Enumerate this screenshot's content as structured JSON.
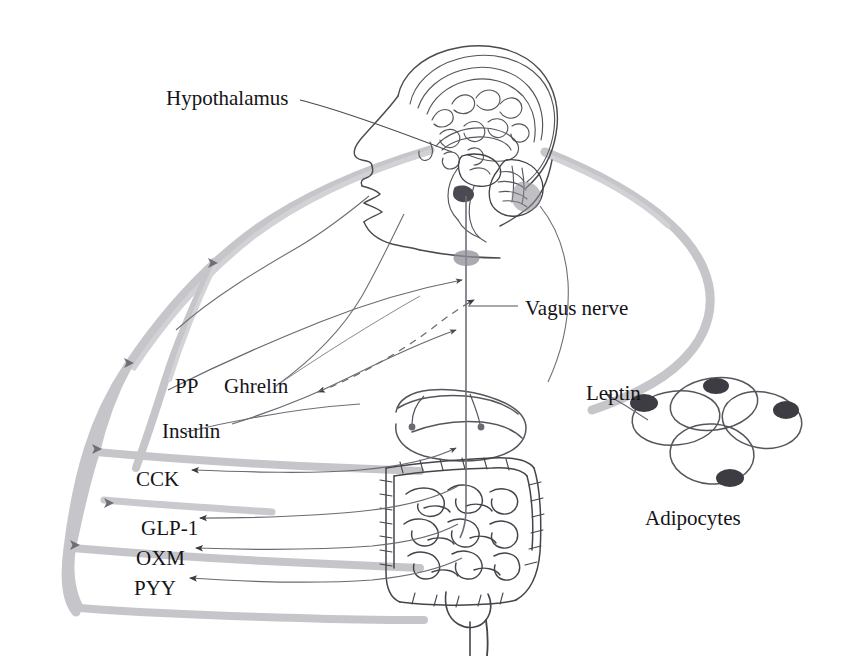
{
  "figure": {
    "kind": "anatomical-diagram",
    "canvas": {
      "width": 847,
      "height": 656
    },
    "background_color": "#ffffff"
  },
  "palette": {
    "text": "#141418",
    "anatomy_ink": "#4a4a50",
    "anatomy_ink_dark": "#2e2e33",
    "pathway_gray": "#bcbcc0",
    "pathway_gray_light": "#cfcfd3",
    "arrow_ink": "#6a6a70",
    "arrowhead": "#3a3a40",
    "nucleus_fill": "#3c3c42"
  },
  "labels": [
    {
      "id": "hypothalamus",
      "text": "Hypothalamus",
      "x": 166,
      "y": 88,
      "anchor": "left"
    },
    {
      "id": "vagus-nerve",
      "text": "Vagus nerve",
      "x": 525,
      "y": 298,
      "anchor": "left"
    },
    {
      "id": "pp",
      "text": "PP",
      "x": 175,
      "y": 376,
      "anchor": "left"
    },
    {
      "id": "ghrelin",
      "text": "Ghrelin",
      "x": 224,
      "y": 376,
      "anchor": "left"
    },
    {
      "id": "leptin",
      "text": "Leptin",
      "x": 586,
      "y": 383,
      "anchor": "left"
    },
    {
      "id": "insulin",
      "text": "Insulin",
      "x": 162,
      "y": 421,
      "anchor": "left"
    },
    {
      "id": "cck",
      "text": "CCK",
      "x": 136,
      "y": 469,
      "anchor": "left"
    },
    {
      "id": "glp1",
      "text": "GLP-1",
      "x": 141,
      "y": 518,
      "anchor": "left"
    },
    {
      "id": "adipocytes",
      "text": "Adipocytes",
      "x": 700,
      "y": 508,
      "anchor": "center"
    },
    {
      "id": "oxm",
      "text": "OXM",
      "x": 136,
      "y": 548,
      "anchor": "left"
    },
    {
      "id": "pyy",
      "text": "PYY",
      "x": 134,
      "y": 578,
      "anchor": "left"
    }
  ],
  "anatomy_parts": [
    {
      "id": "head-profile",
      "name": "human head in profile (sagittal)"
    },
    {
      "id": "brain-section",
      "name": "mid-sagittal brain section with cortex, corpus callosum, brainstem, cerebellum"
    },
    {
      "id": "hypothalamus-node",
      "name": "hypothalamus region marker"
    },
    {
      "id": "stomach",
      "name": "stomach"
    },
    {
      "id": "large-intestine",
      "name": "large intestine / colon frame"
    },
    {
      "id": "small-intestine",
      "name": "small intestine coils"
    },
    {
      "id": "rectum",
      "name": "sigmoid colon and rectum"
    },
    {
      "id": "vagus-trunk",
      "name": "vagus nerve descending trunk with ganglion"
    },
    {
      "id": "adipocyte-cluster",
      "name": "cluster of four adipocytes with nuclei"
    }
  ],
  "pathways": [
    {
      "id": "systemic-left-arc",
      "style": "thick-gray",
      "note": "circulation arc from head down the left body contour"
    },
    {
      "id": "leptin-arc-right",
      "style": "thick-gray",
      "note": "S-curve from head down the right toward adipose tissue"
    },
    {
      "id": "hormone-branch-pp",
      "style": "thin-arrow",
      "note": "PP to brain"
    },
    {
      "id": "hormone-branch-ghrelin",
      "style": "dashed-arrow",
      "note": "Ghrelin bidirectional to brain"
    },
    {
      "id": "hormone-branch-insulin",
      "style": "thin-arrow",
      "note": "Insulin to brain"
    },
    {
      "id": "hormone-branch-cck",
      "style": "thin-arrow",
      "note": "CCK from gut"
    },
    {
      "id": "hormone-branch-glp1",
      "style": "thin-arrow",
      "note": "GLP-1 from gut"
    },
    {
      "id": "hormone-branch-oxm",
      "style": "thin-arrow",
      "note": "OXM from gut"
    },
    {
      "id": "hormone-branch-pyy",
      "style": "thin-arrow",
      "note": "PYY from gut"
    },
    {
      "id": "leptin-arrow",
      "style": "thin-arrow",
      "note": "Leptin released from adipocytes"
    },
    {
      "id": "vagal-afferent",
      "style": "thin-line",
      "note": "vagus nerve gut to brainstem"
    }
  ]
}
